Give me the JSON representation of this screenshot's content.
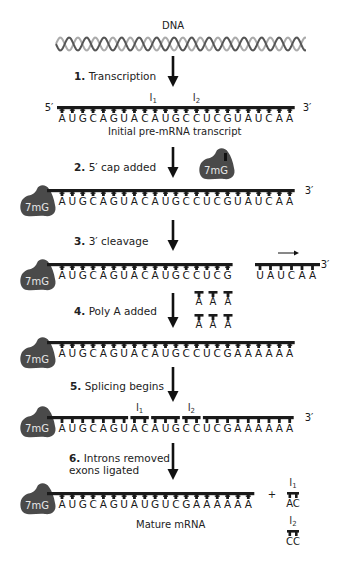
{
  "title": "DNA",
  "colors": {
    "strand": "#1a1a1a",
    "cap_fill": "#4a4a4a",
    "cap_text": "#e8e8e8",
    "helix_dark": "#555555",
    "helix_light": "#aaaaaa",
    "arrow": "#111111"
  },
  "prime5": "5′",
  "prime3": "3′",
  "cap_label": "7mG",
  "intron1_label": "I",
  "intron1_sub": "1",
  "intron2_label": "I",
  "intron2_sub": "2",
  "steps": [
    {
      "num": "1.",
      "label": "Transcription"
    },
    {
      "num": "2.",
      "label": "5′ cap added"
    },
    {
      "num": "3.",
      "label": "3′ cleavage"
    },
    {
      "num": "4.",
      "label": "Poly A added"
    },
    {
      "num": "5.",
      "label": "Splicing begins"
    },
    {
      "num": "6.",
      "label": "Introns removed",
      "label2": "exons ligated"
    }
  ],
  "sequences": {
    "initial": "AUGCAGUACAUGCCUCGUAUCAA",
    "capped": "AUGCAGUACAUGCCUCGUAUCAA",
    "cleaved_main": "AUGCAGUACAUGCCUCG",
    "cleaved_fragment": "UAUCAA",
    "polyA_free": [
      "A",
      "A",
      "A",
      "A",
      "A",
      "A"
    ],
    "polyadenylated": "AUGCAGUACAUGCCUCGAAAAAA",
    "splicing": "AUGCAGUACAUGCCUCGAAAAAA",
    "mature": "AUGCAGUAUGUCGAAAAAA",
    "intron1": "AC",
    "intron2": "CC"
  },
  "captions": {
    "initial": "Initial pre-mRNA transcript",
    "mature": "Mature mRNA"
  },
  "plus_sign": "+"
}
